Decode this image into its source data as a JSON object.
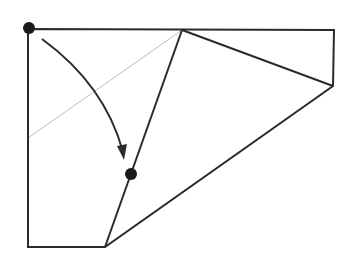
{
  "diagram": {
    "type": "paper-folding",
    "colors": {
      "stroke": "#2b2b2b",
      "thin_line": "#bdbdbd",
      "dot": "#1a1a1a",
      "background": "#ffffff"
    },
    "outline_points": [
      [
        28,
        29
      ],
      [
        334,
        30
      ],
      [
        333,
        86
      ],
      [
        105,
        247
      ],
      [
        28,
        247
      ]
    ],
    "crease_lines": [
      {
        "name": "crease-top-to-bottom",
        "from": [
          182,
          30
        ],
        "to": [
          105,
          247
        ]
      },
      {
        "name": "crease-top-to-right",
        "from": [
          182,
          30
        ],
        "to": [
          333,
          86
        ]
      }
    ],
    "reference_line": {
      "from": [
        182,
        30
      ],
      "to": [
        28,
        138
      ]
    },
    "fold_arrow": {
      "start": [
        42,
        39
      ],
      "control": [
        105,
        85
      ],
      "end": [
        123,
        160
      ]
    },
    "points": [
      {
        "name": "corner-dot",
        "x": 29,
        "y": 28,
        "r": 6
      },
      {
        "name": "target-dot",
        "x": 131,
        "y": 174,
        "r": 6
      }
    ]
  }
}
